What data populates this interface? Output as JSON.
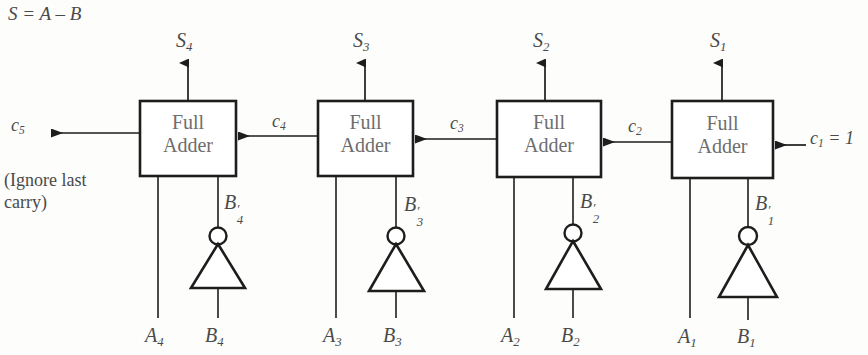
{
  "figure": {
    "equation": "S = A – B",
    "note_line1": "(Ignore last",
    "note_line2": "carry)",
    "carry_out_label": "c",
    "carry_out_sub": "5",
    "carry_in_text": "= 1",
    "carry_in_label": "c",
    "carry_in_sub": "1",
    "colors": {
      "ink": "#2b2b2b",
      "text": "#4a4a4a",
      "box_text": "#6d6d6d",
      "background": "#fdfdfb"
    }
  },
  "stages": [
    {
      "id": "stage-4",
      "box_line1": "Full",
      "box_line2": "Adder",
      "sum_label": "S",
      "sum_sub": "4",
      "carry_out_label": "c",
      "carry_out_sub": "5",
      "carry_in_label": "c",
      "carry_in_sub": "4",
      "b_not_label": "B",
      "b_not_sub": "4",
      "a_label": "A",
      "a_sub": "4",
      "b_label": "B",
      "b_sub": "4",
      "inverter": "not-gate"
    },
    {
      "id": "stage-3",
      "box_line1": "Full",
      "box_line2": "Adder",
      "sum_label": "S",
      "sum_sub": "3",
      "carry_out_label": "c",
      "carry_out_sub": "4",
      "carry_in_label": "c",
      "carry_in_sub": "3",
      "b_not_label": "B",
      "b_not_sub": "3",
      "a_label": "A",
      "a_sub": "3",
      "b_label": "B",
      "b_sub": "3",
      "inverter": "not-gate"
    },
    {
      "id": "stage-2",
      "box_line1": "Full",
      "box_line2": "Adder",
      "sum_label": "S",
      "sum_sub": "2",
      "carry_out_label": "c",
      "carry_out_sub": "3",
      "carry_in_label": "c",
      "carry_in_sub": "2",
      "b_not_label": "B",
      "b_not_sub": "2",
      "a_label": "A",
      "a_sub": "2",
      "b_label": "B",
      "b_sub": "2",
      "inverter": "not-gate"
    },
    {
      "id": "stage-1",
      "box_line1": "Full",
      "box_line2": "Adder",
      "sum_label": "S",
      "sum_sub": "1",
      "carry_out_label": "c",
      "carry_out_sub": "2",
      "carry_in_label": "c",
      "carry_in_sub": "1",
      "b_not_label": "B",
      "b_not_sub": "1",
      "a_label": "A",
      "a_sub": "1",
      "b_label": "B",
      "b_sub": "1",
      "inverter": "not-gate"
    }
  ]
}
